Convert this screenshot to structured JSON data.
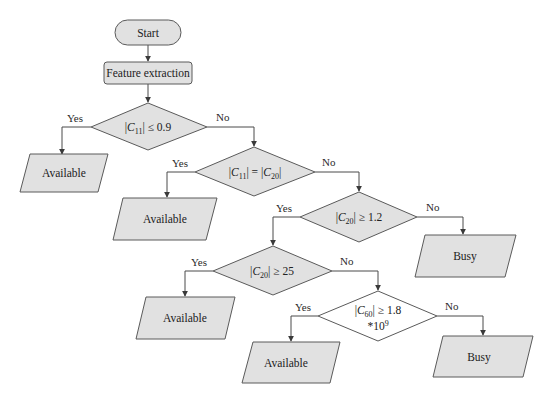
{
  "diagram": {
    "type": "flowchart",
    "nodes": [
      {
        "id": "start",
        "kind": "terminal",
        "label": "Start"
      },
      {
        "id": "feature",
        "kind": "process",
        "label": "Feature extraction"
      },
      {
        "id": "d1",
        "kind": "decision",
        "label": "|C11| ≤ 0.9",
        "parts": [
          {
            "t": "|"
          },
          {
            "t": "C",
            "it": true
          },
          {
            "t": "11",
            "sub": true
          },
          {
            "t": "| ≤ 0.9"
          }
        ]
      },
      {
        "id": "out1",
        "kind": "io",
        "label": "Available"
      },
      {
        "id": "d2",
        "kind": "decision",
        "label": "|C11| = |C20|",
        "parts": [
          {
            "t": "|"
          },
          {
            "t": "C",
            "it": true
          },
          {
            "t": "11",
            "sub": true
          },
          {
            "t": "| = |"
          },
          {
            "t": "C",
            "it": true
          },
          {
            "t": "20",
            "sub": true
          },
          {
            "t": "|"
          }
        ]
      },
      {
        "id": "out2",
        "kind": "io",
        "label": "Available"
      },
      {
        "id": "d3",
        "kind": "decision",
        "label": "|C20| ≥ 1.2",
        "parts": [
          {
            "t": "|"
          },
          {
            "t": "C",
            "it": true
          },
          {
            "t": "20",
            "sub": true
          },
          {
            "t": "| ≥ 1.2"
          }
        ]
      },
      {
        "id": "out3",
        "kind": "io",
        "label": "Busy"
      },
      {
        "id": "d4",
        "kind": "decision",
        "label": "|C20| ≥ 25",
        "parts": [
          {
            "t": "|"
          },
          {
            "t": "C",
            "it": true
          },
          {
            "t": "20",
            "sub": true
          },
          {
            "t": "| ≥ 25"
          }
        ]
      },
      {
        "id": "out4",
        "kind": "io",
        "label": "Available"
      },
      {
        "id": "d5",
        "kind": "decision",
        "label": "|C60| ≥ 1.8 *10^9",
        "parts": [
          {
            "t": "|"
          },
          {
            "t": "C",
            "it": true
          },
          {
            "t": "60",
            "sub": true
          },
          {
            "t": "| ≥ 1.8"
          }
        ],
        "line2": [
          {
            "t": "*10"
          },
          {
            "t": "9",
            "sup": true
          }
        ]
      },
      {
        "id": "out5",
        "kind": "io",
        "label": "Available"
      },
      {
        "id": "out6",
        "kind": "io",
        "label": "Busy"
      }
    ],
    "edges": [
      {
        "from": "start",
        "to": "feature",
        "label": ""
      },
      {
        "from": "feature",
        "to": "d1",
        "label": ""
      },
      {
        "from": "d1",
        "to": "out1",
        "label": "Yes"
      },
      {
        "from": "d1",
        "to": "d2",
        "label": "No"
      },
      {
        "from": "d2",
        "to": "out2",
        "label": "Yes"
      },
      {
        "from": "d2",
        "to": "d3",
        "label": "No"
      },
      {
        "from": "d3",
        "to": "d4",
        "label": "Yes"
      },
      {
        "from": "d3",
        "to": "out3",
        "label": "No"
      },
      {
        "from": "d4",
        "to": "out4",
        "label": "Yes"
      },
      {
        "from": "d4",
        "to": "d5",
        "label": "No"
      },
      {
        "from": "d5",
        "to": "out5",
        "label": "Yes"
      },
      {
        "from": "d5",
        "to": "out6",
        "label": "No"
      }
    ],
    "colors": {
      "shape_fill": "#e1e1e1",
      "decision_last_fill": "#ffffff",
      "stroke": "#5a5a5a"
    }
  }
}
